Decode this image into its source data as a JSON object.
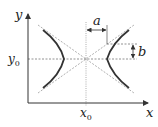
{
  "diagram": {
    "type": "hyperbola",
    "labels": {
      "x_axis": "x",
      "y_axis": "y",
      "x_center": "x",
      "x_center_sub": "0",
      "y_center": "y",
      "y_center_sub": "0",
      "semi_axis_a": "a",
      "semi_axis_b": "b"
    },
    "elements": [
      "x-axis",
      "y-axis",
      "asymptotes",
      "left-branch",
      "right-branch",
      "center-guides",
      "dimension-a",
      "dimension-b"
    ],
    "colors": {
      "curve": "#333333",
      "axis": "#333333",
      "dashed": "#999999",
      "text": "#222222"
    }
  }
}
